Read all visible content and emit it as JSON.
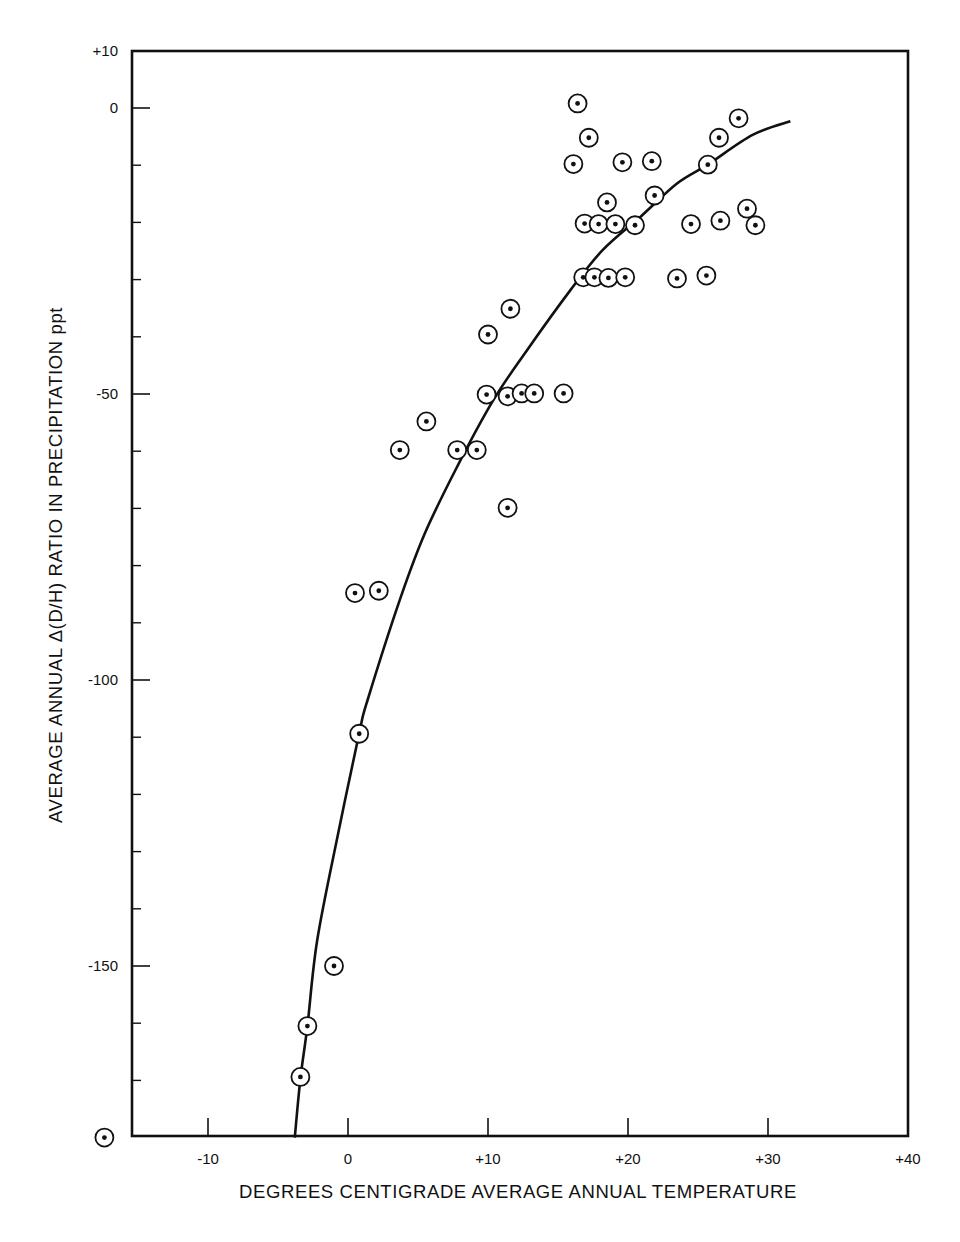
{
  "chart_data": {
    "type": "scatter",
    "title": "",
    "xlabel": "DEGREES CENTIGRADE AVERAGE ANNUAL TEMPERATURE",
    "ylabel": "AVERAGE ANNUAL  Δ(D/H) RATIO IN PRECIPITATION ppt",
    "xlim": [
      -15.4,
      40
    ],
    "ylim": [
      -180,
      10
    ],
    "grid": false,
    "legend": null,
    "x_ticks": [
      {
        "value": -10,
        "label": "-10"
      },
      {
        "value": 0,
        "label": "0"
      },
      {
        "value": 10,
        "label": "+10"
      },
      {
        "value": 20,
        "label": "+20"
      },
      {
        "value": 30,
        "label": "+30"
      },
      {
        "value": 40,
        "label": "+40"
      }
    ],
    "y_ticks": [
      {
        "value": 10,
        "label": "+10"
      },
      {
        "value": 0,
        "label": "0"
      },
      {
        "value": -50,
        "label": "-50"
      },
      {
        "value": -100,
        "label": "-100"
      },
      {
        "value": -150,
        "label": "-150"
      }
    ],
    "y_minor_ticks": [
      -10,
      -20,
      -30,
      -40,
      -60,
      -70,
      -80,
      -90,
      -110,
      -120,
      -130,
      -140,
      -160,
      -170
    ],
    "marker": "circled-dot",
    "series": [
      {
        "name": "observations",
        "points": [
          {
            "x": 16.4,
            "y": 0.8
          },
          {
            "x": 17.2,
            "y": -5.2
          },
          {
            "x": 16.1,
            "y": -9.8
          },
          {
            "x": 19.6,
            "y": -9.5
          },
          {
            "x": 21.7,
            "y": -9.3
          },
          {
            "x": 18.5,
            "y": -16.5
          },
          {
            "x": 21.9,
            "y": -15.3
          },
          {
            "x": 16.9,
            "y": -20.2
          },
          {
            "x": 17.9,
            "y": -20.3
          },
          {
            "x": 19.1,
            "y": -20.3
          },
          {
            "x": 20.5,
            "y": -20.5
          },
          {
            "x": 16.8,
            "y": -29.6
          },
          {
            "x": 17.6,
            "y": -29.6
          },
          {
            "x": 18.6,
            "y": -29.7
          },
          {
            "x": 19.8,
            "y": -29.6
          },
          {
            "x": 27.9,
            "y": -1.8
          },
          {
            "x": 26.5,
            "y": -5.2
          },
          {
            "x": 25.7,
            "y": -9.9
          },
          {
            "x": 24.5,
            "y": -20.3
          },
          {
            "x": 26.6,
            "y": -19.7
          },
          {
            "x": 28.5,
            "y": -17.6
          },
          {
            "x": 29.1,
            "y": -20.5
          },
          {
            "x": 23.5,
            "y": -29.8
          },
          {
            "x": 25.6,
            "y": -29.3
          },
          {
            "x": 11.6,
            "y": -35.1
          },
          {
            "x": 10.0,
            "y": -39.6
          },
          {
            "x": 9.9,
            "y": -50.1
          },
          {
            "x": 11.4,
            "y": -50.4
          },
          {
            "x": 12.4,
            "y": -49.9
          },
          {
            "x": 13.3,
            "y": -49.9
          },
          {
            "x": 15.4,
            "y": -49.9
          },
          {
            "x": 5.6,
            "y": -54.8
          },
          {
            "x": 3.7,
            "y": -59.8
          },
          {
            "x": 7.8,
            "y": -59.8
          },
          {
            "x": 9.2,
            "y": -59.8
          },
          {
            "x": 11.4,
            "y": -69.9
          },
          {
            "x": 0.5,
            "y": -84.8
          },
          {
            "x": 2.2,
            "y": -84.4
          },
          {
            "x": 0.8,
            "y": -109.4
          },
          {
            "x": -1.0,
            "y": -150.0
          },
          {
            "x": -2.9,
            "y": -160.5
          },
          {
            "x": -3.4,
            "y": -169.4
          },
          {
            "x": -17.4,
            "y": -180.0
          }
        ]
      }
    ],
    "fit_curve": {
      "name": "fitted curve",
      "points": [
        {
          "x": -3.8,
          "y": -180.0
        },
        {
          "x": -3.4,
          "y": -169.7
        },
        {
          "x": -2.9,
          "y": -160.5
        },
        {
          "x": -2.2,
          "y": -145.5
        },
        {
          "x": -0.7,
          "y": -126.8
        },
        {
          "x": 0.8,
          "y": -109.3
        },
        {
          "x": 1.4,
          "y": -103.5
        },
        {
          "x": 3.7,
          "y": -86.0
        },
        {
          "x": 5.5,
          "y": -74.3
        },
        {
          "x": 7.8,
          "y": -62.7
        },
        {
          "x": 10.4,
          "y": -51.0
        },
        {
          "x": 12.8,
          "y": -42.3
        },
        {
          "x": 15.9,
          "y": -31.8
        },
        {
          "x": 18.2,
          "y": -24.8
        },
        {
          "x": 20.9,
          "y": -19.0
        },
        {
          "x": 23.5,
          "y": -13.2
        },
        {
          "x": 25.7,
          "y": -9.9
        },
        {
          "x": 28.9,
          "y": -4.7
        },
        {
          "x": 31.6,
          "y": -2.3
        }
      ]
    }
  }
}
